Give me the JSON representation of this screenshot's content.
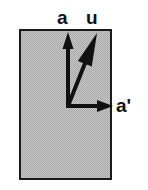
{
  "figure": {
    "width": 148,
    "height": 190,
    "background_color": "#ffffff"
  },
  "shape": {
    "name": "shaded-rectangle",
    "x": 19,
    "y": 29,
    "width": 93,
    "height": 151,
    "fill_color": "#bdbdbd",
    "stroke_color": "#1a1a1a",
    "stroke_width": 2,
    "fill_style": "halftone-dither-gray"
  },
  "origin": {
    "x": 68,
    "y": 106
  },
  "vectors": [
    {
      "id": "a",
      "label": "a",
      "name": "vector-a",
      "description": "vertical arrow pointing up",
      "from": {
        "x": 68,
        "y": 106
      },
      "to": {
        "x": 68,
        "y": 32
      },
      "color": "#111111",
      "line_width": 4,
      "arrowhead": "filled-triangle",
      "label_position": {
        "x": 57,
        "y": 8
      }
    },
    {
      "id": "u",
      "label": "u",
      "name": "vector-u",
      "description": "diagonal arrow pointing up and to the right",
      "from": {
        "x": 68,
        "y": 106
      },
      "to": {
        "x": 97,
        "y": 33
      },
      "color": "#111111",
      "line_width": 4,
      "arrowhead": "large-filled-triangle",
      "label_position": {
        "x": 86,
        "y": 8
      }
    },
    {
      "id": "a-prime",
      "label": "a'",
      "name": "vector-a-prime",
      "description": "horizontal arrow pointing right",
      "from": {
        "x": 68,
        "y": 106
      },
      "to": {
        "x": 113,
        "y": 106
      },
      "color": "#111111",
      "line_width": 4,
      "arrowhead": "filled-triangle",
      "label_position": {
        "x": 116,
        "y": 96
      }
    }
  ],
  "labels": {
    "a": "a",
    "u": "u",
    "a_prime": "a'"
  }
}
